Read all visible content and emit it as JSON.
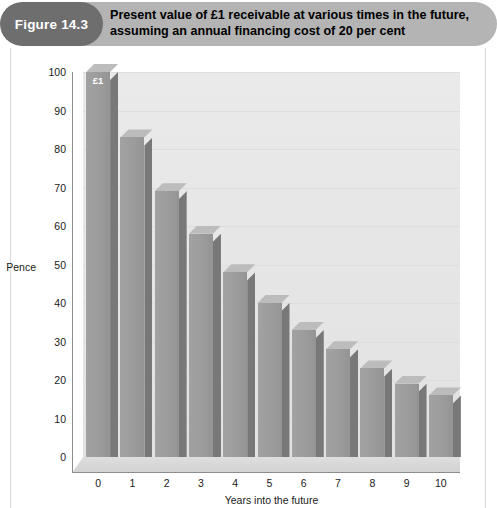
{
  "figure": {
    "badge_label": "Figure 14.3",
    "title_line1": "Present value of £1 receivable at various times in the future,",
    "title_line2": "assuming an annual financing cost of 20 per cent",
    "badge_color": "#6e6e6e",
    "banner_color": "#b4b4b4"
  },
  "chart_data": {
    "type": "bar",
    "title": "Present value of £1 receivable at various times in the future, assuming an annual financing cost of 20 per cent",
    "xlabel": "Years into the future",
    "ylabel": "Pence",
    "categories": [
      "0",
      "1",
      "2",
      "3",
      "4",
      "5",
      "6",
      "7",
      "8",
      "9",
      "10"
    ],
    "values": [
      100,
      83,
      69,
      58,
      48,
      40,
      33,
      28,
      23,
      19,
      16
    ],
    "ylim": [
      0,
      100
    ],
    "yticks": [
      0,
      10,
      20,
      30,
      40,
      50,
      60,
      70,
      80,
      90,
      100
    ],
    "ytick_labels": [
      "0",
      "10",
      "20",
      "30",
      "40",
      "50",
      "60",
      "70",
      "80",
      "90",
      "100"
    ],
    "grid": true,
    "legend": false,
    "annotations": [
      {
        "category": "0",
        "text": "£1",
        "position": "inside-top"
      }
    ],
    "series_color": "#9c9c9c",
    "plot_background": "#e6e6e6",
    "style": "3d-column"
  },
  "colors": {
    "bar_face": "#9c9c9c",
    "bar_side": "#787878",
    "bar_top": "#bcbcbc",
    "plot_bg": "#e6e6e6",
    "gridline": "#dedede",
    "axis": "#8d8d8d",
    "text": "#1a1a1a"
  },
  "bottom_caption": ""
}
